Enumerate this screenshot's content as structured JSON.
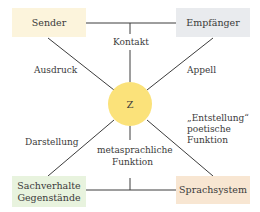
{
  "diagram": {
    "center": {
      "label": "Z",
      "color": "#fbe27a"
    },
    "corners": {
      "top_left": {
        "label": "Sender",
        "color": "#fcf4dc"
      },
      "top_right": {
        "label": "Empfänger",
        "color": "#e9ebee"
      },
      "bottom_left": {
        "line1": "Sachverhalte",
        "line2": "Gegenstände",
        "color": "#e8f3de"
      },
      "bottom_right": {
        "label": "Sprachsystem",
        "color": "#f8e6d2"
      }
    },
    "functions": {
      "top": "Kontakt",
      "upper_left": "Ausdruck",
      "upper_right": "Appell",
      "lower_left": "Darstellung",
      "bottom_line1": "metasprachliche",
      "bottom_line2": "Funktion",
      "lower_right_line1": "„Entstellung“",
      "lower_right_line2": "poetische",
      "lower_right_line3": "Funktion"
    },
    "line_color": "#3c3c3c"
  }
}
